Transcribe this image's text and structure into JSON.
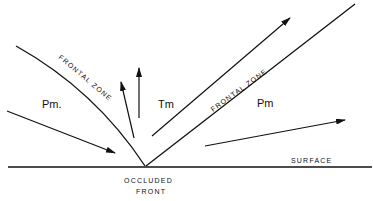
{
  "diagram": {
    "type": "occluded front cross-section",
    "labels": {
      "frontal_zone_left": "FRONTAL ZONE",
      "frontal_zone_right": "FRONTAL ZONE",
      "air_mass_left": "Pm.",
      "air_mass_center": "Tm",
      "air_mass_right": "Pm",
      "surface": "SURFACE",
      "occluded_front_line1": "OCCLUDED",
      "occluded_front_line2": "FRONT"
    },
    "colors": {
      "stroke": "#111111",
      "background": "#ffffff"
    }
  }
}
